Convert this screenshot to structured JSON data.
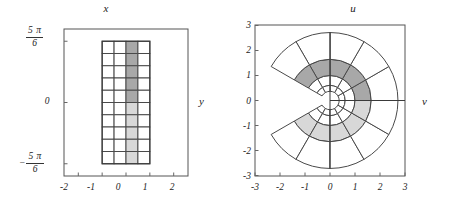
{
  "figure": {
    "panels": [
      {
        "id": "left",
        "title": "x",
        "side_label": "y",
        "x_ticks": [
          "-2",
          "-1",
          "0",
          "1",
          "2"
        ],
        "y_ticks": [
          {
            "sign": "",
            "num": "5 π",
            "den": "6"
          },
          {
            "sign": "",
            "plain": "0"
          },
          {
            "sign": "−",
            "num": "5 π",
            "den": "6"
          }
        ]
      },
      {
        "id": "right",
        "title": "u",
        "side_label": "v",
        "x_ticks": [
          "-3",
          "-2",
          "-1",
          "0",
          "1",
          "2",
          "3"
        ],
        "y_ticks": [
          "3",
          "2",
          "1",
          "0",
          "-1",
          "-2",
          "-3"
        ]
      }
    ]
  },
  "chart_data": {
    "type": "line",
    "panels": [
      {
        "name": "domain-rectangle-grid",
        "type": "grid",
        "xlabel": "x",
        "ylabel": "y",
        "xlim": [
          -2.6,
          2.6
        ],
        "ylim": [
          -3.1415,
          3.1415
        ],
        "x_tick_values": [
          -2,
          -1,
          0,
          1,
          2
        ],
        "x_tick_labels": [
          "-2",
          "-1",
          "0",
          "1",
          "2"
        ],
        "y_tick_values": [
          2.618,
          0,
          -2.618
        ],
        "y_tick_labels": [
          "5π/6",
          "0",
          "-5π/6"
        ],
        "grid": true,
        "rectangle": {
          "x_min": -1,
          "x_max": 1,
          "y_min": -2.618,
          "y_max": 2.618
        },
        "columns": 4,
        "rows": 10,
        "column_edges": [
          -1,
          -0.5,
          0,
          0.5,
          1
        ],
        "row_height": 0.5236,
        "shaded_column_index": 2,
        "shaded_column_range": [
          0,
          0.5
        ],
        "shading": {
          "dark_gray": "#a8a8a8",
          "light_gray": "#d8d8d8",
          "dark_rows_from_top": 5,
          "light_rows_from_bottom": 5
        }
      },
      {
        "name": "image-under-exponential-map",
        "type": "polar-grid",
        "xlabel": "u",
        "ylabel": "v",
        "xlim": [
          -3,
          3
        ],
        "ylim": [
          -3,
          3
        ],
        "x_tick_values": [
          -3,
          -2,
          -1,
          0,
          1,
          2,
          3
        ],
        "x_tick_labels": [
          "-3",
          "-2",
          "-1",
          "0",
          "1",
          "2",
          "3"
        ],
        "y_tick_values": [
          3,
          2,
          1,
          0,
          -1,
          -2,
          -3
        ],
        "y_tick_labels": [
          "3",
          "2",
          "1",
          "0",
          "-1",
          "-2",
          "-3"
        ],
        "grid": true,
        "radii": [
          0.3679,
          0.6065,
          1.0,
          1.6487,
          2.7183
        ],
        "angle_min_deg": -150,
        "angle_max_deg": 150,
        "angular_sectors": 10,
        "angular_step_deg": 30,
        "shaded_ring_index": 2,
        "shaded_ring_radii": [
          1.0,
          1.6487
        ],
        "shading": {
          "dark_gray": "#a8a8a8",
          "light_gray": "#d8d8d8",
          "dark_sectors_deg": [
            [
              0,
              150
            ]
          ],
          "light_sectors_deg": [
            [
              -150,
              0
            ]
          ]
        }
      }
    ]
  }
}
